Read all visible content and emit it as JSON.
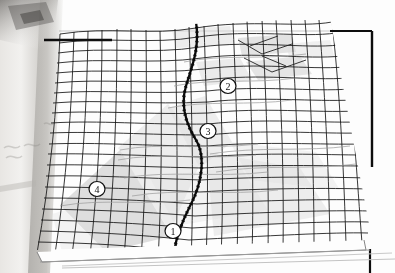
{
  "figure": {
    "kind": "3d-surface-mesh-plot",
    "medium": "scanned-page-photograph",
    "background_color": "#fdfdfd",
    "mesh_color": "#1a1a1a",
    "shade_color": "#d9d9d9",
    "frame_color": "#000000",
    "scan_edge_color": "#b9b7b4",
    "labels": [
      {
        "id": "label-1",
        "text": "1",
        "x": 173,
        "y": 231
      },
      {
        "id": "label-2",
        "text": "2",
        "x": 228,
        "y": 86
      },
      {
        "id": "label-3",
        "text": "3",
        "x": 208,
        "y": 131
      },
      {
        "id": "label-4",
        "text": "4",
        "x": 97,
        "y": 189
      }
    ],
    "frame": {
      "top_tick_y": 40,
      "top_tick_x_start": 44,
      "top_tick_x_end": 108,
      "top_edge_y": 31,
      "right_edge_x": 372,
      "right_edge_y_start": 31,
      "right_edge_y_end": 167,
      "bottom_tick_x": 370,
      "bottom_tick_y_start": 248,
      "bottom_tick_y_end": 273
    },
    "grid": {
      "rows": 22,
      "cols": 20
    },
    "ridge_curve_label": "dark-s-curve",
    "base_plinth_label": "base-plane"
  }
}
